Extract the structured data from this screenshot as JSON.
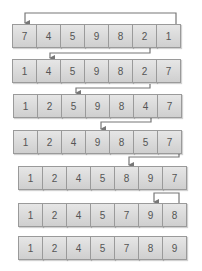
{
  "diagram": {
    "colors": {
      "cell_border": "#9a9a9a",
      "cell_top": "#e6e6e6",
      "cell_bottom": "#cfcfcf",
      "line": "#777777",
      "text": "#555555"
    },
    "rows": [
      {
        "values": [
          "7",
          "4",
          "5",
          "9",
          "8",
          "2",
          "1"
        ]
      },
      {
        "values": [
          "1",
          "4",
          "5",
          "9",
          "8",
          "2",
          "7"
        ]
      },
      {
        "values": [
          "1",
          "2",
          "5",
          "9",
          "8",
          "4",
          "7"
        ]
      },
      {
        "values": [
          "1",
          "2",
          "4",
          "9",
          "8",
          "5",
          "7"
        ]
      },
      {
        "values": [
          "1",
          "2",
          "4",
          "5",
          "8",
          "9",
          "7"
        ]
      },
      {
        "values": [
          "1",
          "2",
          "4",
          "5",
          "7",
          "9",
          "8"
        ]
      },
      {
        "values": [
          "1",
          "2",
          "4",
          "5",
          "7",
          "8",
          "9"
        ]
      }
    ],
    "swaps": [
      {
        "from_index": 6,
        "to_index": 0
      },
      {
        "from_index": 5,
        "to_index": 1
      },
      {
        "from_index": 5,
        "to_index": 2
      },
      {
        "from_index": 5,
        "to_index": 3
      },
      {
        "from_index": 6,
        "to_index": 4
      },
      {
        "from_index": 6,
        "to_index": 5
      }
    ]
  }
}
